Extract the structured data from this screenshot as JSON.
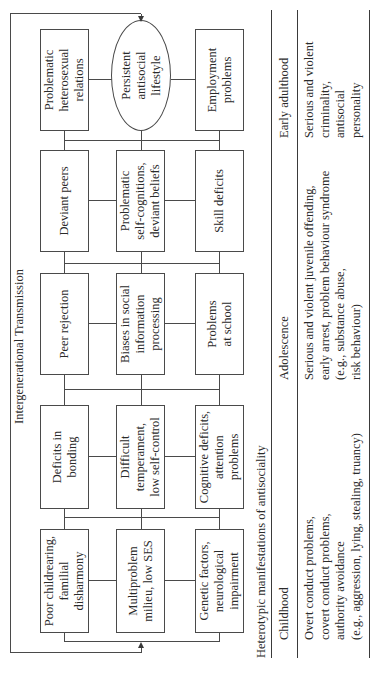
{
  "figure": {
    "title": "Intergenerational Transmission",
    "stages": [
      {
        "name": "stage-1",
        "items": [
          "Poor childrearing,\nfamilial\ndisharmony",
          "Multiproblem\nmilieu, low SES",
          "Genetic factors,\nneurological\nimpairment"
        ]
      },
      {
        "name": "stage-2",
        "items": [
          "Deficits in\nbonding",
          "Difficult\ntemperament,\nlow self-control",
          "Cognitive deficits,\nattention\nproblems"
        ]
      },
      {
        "name": "stage-3",
        "items": [
          "Peer rejection",
          "Biases in social\ninformation\nprocessing",
          "Problems\nat school"
        ]
      },
      {
        "name": "stage-4",
        "items": [
          "Deviant peers",
          "Problematic\nself-cognitions,\ndeviant beliefs",
          "Skill deficits"
        ]
      },
      {
        "name": "stage-5",
        "items": [
          "Problematic\nheterosexual\nrelations",
          "Persistent\nantisocial\nlifestyle",
          "Employment\nproblems"
        ]
      }
    ]
  },
  "table": {
    "title": "Heterotypic manifestations of antisociality",
    "columns": [
      {
        "header": "Childhood",
        "content": "Overt conduct problems,\ncovert conduct problems,\nauthority avoidance\n(e.g., aggression, lying, stealing, truancy)"
      },
      {
        "header": "Adolescence",
        "content": "Serious and violent juvenile offending,\nearly arrest, problem behaviour syndrome\n   (e.g., substance abuse,\n   risk behaviour)"
      },
      {
        "header": "Early adulthood",
        "content": "Serious and violent\ncriminality,\nantisocial\npersonality"
      }
    ]
  },
  "colors": {
    "line": "#4a4a4a",
    "text": "#2a2a2a",
    "background": "#ffffff"
  }
}
